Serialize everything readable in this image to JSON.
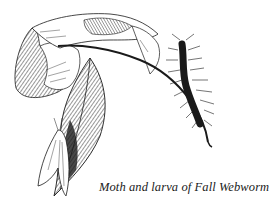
{
  "figure": {
    "caption": "Moth and larva of Fall Webworm",
    "subjects": [
      "moth",
      "larva",
      "leaves",
      "branch"
    ],
    "colors": {
      "ink": "#1a1a1a",
      "paper": "#ffffff"
    }
  }
}
